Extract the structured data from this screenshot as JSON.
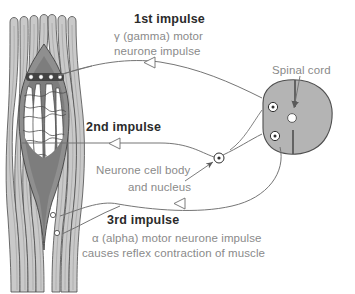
{
  "figure": {
    "background_color": "#ffffff"
  },
  "colors": {
    "muscle_fiber_fill": "#c9c9c9",
    "muscle_fiber_outline": "#4a4a4a",
    "spindle_capsule_fill": "#8f8f8f",
    "intrafusal_fill": "#ffffff",
    "spinal_cord_fill": "#b4b4b4",
    "spinal_cord_outline": "#4f4f4f",
    "leader_line": "#6e6e6e",
    "text_body": "#8a8a8a",
    "text_heading": "#2b2b2b"
  },
  "labels": {
    "impulse1": {
      "heading": "1st impulse",
      "line1": "γ (gamma) motor",
      "line2": "neurone impulse"
    },
    "impulse2": {
      "heading": "2nd impulse"
    },
    "cell_body": {
      "line1": "Neurone cell body",
      "line2": "and nucleus"
    },
    "impulse3": {
      "heading": "3rd impulse",
      "line1": "α (alpha) motor neurone impulse",
      "line2": "causes reflex contraction of muscle"
    },
    "spinal_cord": {
      "text": "Spinal cord"
    }
  },
  "structures": {
    "muscle": "extrafusal muscle fibres",
    "spindle": "muscle spindle capsule",
    "intrafusal_fibres": "intrafusal fibres with annulospiral sensory endings",
    "spinal_cord": "spinal cord cross-section with grey matter",
    "cell_body_marker": "neurone cell body and nucleus",
    "motor_end_plates": "motor end plates on muscle fibres"
  },
  "arrows": {
    "impulse1_direction": "right-to-left toward muscle spindle",
    "impulse2_direction": "right-to-left from spindle to spinal cord",
    "impulse3_direction": "left-to-right from spinal cord to muscle"
  }
}
